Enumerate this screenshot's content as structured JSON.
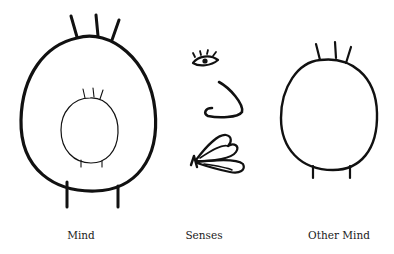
{
  "figure": {
    "labels": {
      "mind": "Mind",
      "senses": "Senses",
      "other_mind": "Other Mind"
    },
    "elements": {
      "mind": "large oval with inner small oval, three spikes on top, two legs",
      "senses": [
        "eye",
        "nose",
        "hand"
      ],
      "other_mind": "medium oval with three spikes on top, two legs"
    },
    "colors": {
      "ink": "#111111",
      "background": "#ffffff"
    }
  }
}
